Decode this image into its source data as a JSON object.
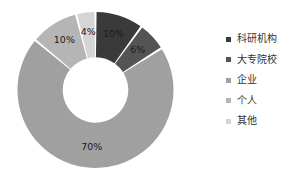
{
  "chart_data": {
    "type": "pie",
    "variant": "donut",
    "title": "",
    "subtitle": "",
    "xlabel": "",
    "ylabel": "",
    "grid": false,
    "legend_position": "right",
    "start_angle_deg": 0,
    "direction": "clockwise",
    "hole_ratio": 0.42,
    "categories": [
      "科研机构",
      "大专院校",
      "企业",
      "个人",
      "其他"
    ],
    "values": [
      10,
      6,
      70,
      10,
      4
    ],
    "value_unit": "%",
    "data_labels": [
      "10%",
      "6%",
      "70%",
      "10%",
      "4%"
    ],
    "colors": [
      "#3a3a3a",
      "#545454",
      "#a0a0a0",
      "#b5b5b5",
      "#d5d5d5"
    ],
    "slice_gap_color": "#ffffff",
    "label_color": "#1a1a1a",
    "slices": [
      {
        "label": "科研机构",
        "value": 10,
        "data_label": "10%",
        "color": "#3a3a3a"
      },
      {
        "label": "大专院校",
        "value": 6,
        "data_label": "6%",
        "color": "#545454"
      },
      {
        "label": "企业",
        "value": 70,
        "data_label": "70%",
        "color": "#a0a0a0"
      },
      {
        "label": "个人",
        "value": 10,
        "data_label": "10%",
        "color": "#b5b5b5"
      },
      {
        "label": "其他",
        "value": 4,
        "data_label": "4%",
        "color": "#d5d5d5"
      }
    ]
  },
  "legend": {
    "items": [
      {
        "label": "科研机构",
        "color": "#3a3a3a"
      },
      {
        "label": "大专院校",
        "color": "#545454"
      },
      {
        "label": "企业",
        "color": "#a0a0a0"
      },
      {
        "label": "个人",
        "color": "#b5b5b5"
      },
      {
        "label": "其他",
        "color": "#d5d5d5"
      }
    ]
  }
}
